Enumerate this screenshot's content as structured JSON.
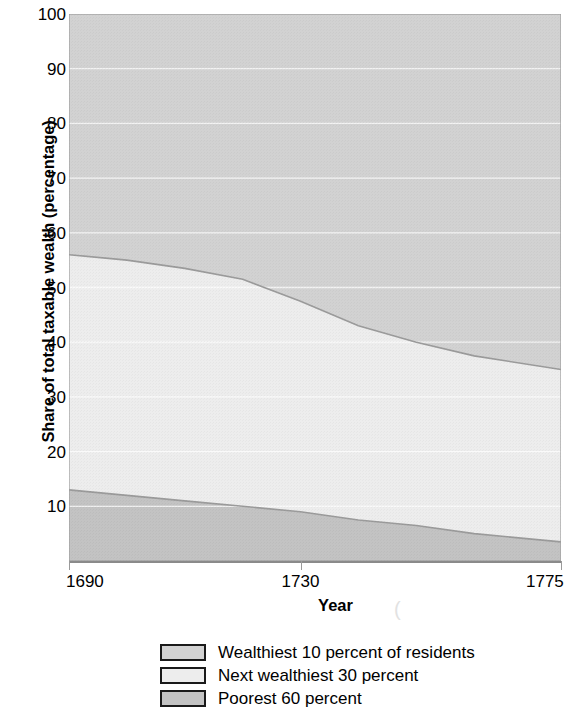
{
  "chart_data": {
    "type": "area",
    "title": "",
    "subtitle": "",
    "xlabel": "Year",
    "ylabel": "Share of total taxable wealth (percentage)",
    "xlim": [
      1690,
      1775
    ],
    "ylim": [
      0,
      100
    ],
    "grid": true,
    "stacked": true,
    "legend_position": "bottom",
    "x_tick_labels": [
      "1690",
      "1730",
      "1775"
    ],
    "x_ticks": [
      1690,
      1730,
      1775
    ],
    "y_tick_labels": [
      "100",
      "90",
      "80",
      "70",
      "60",
      "50",
      "40",
      "30",
      "20",
      "10"
    ],
    "y_ticks": [
      100,
      90,
      80,
      70,
      60,
      50,
      40,
      30,
      20,
      10
    ],
    "x": [
      1690,
      1700,
      1710,
      1720,
      1730,
      1740,
      1750,
      1760,
      1775
    ],
    "series": [
      {
        "name": "Wealthiest 10 percent of residents",
        "color": "#d2d2d2",
        "values": [
          44.0,
          45.0,
          46.5,
          48.5,
          52.5,
          57.0,
          60.0,
          62.5,
          65.0
        ],
        "cumulative_top": [
          100,
          100,
          100,
          100,
          100,
          100,
          100,
          100,
          100
        ],
        "cumulative_bottom": [
          56.0,
          55.0,
          53.5,
          51.5,
          47.5,
          43.0,
          40.0,
          37.5,
          35.0
        ]
      },
      {
        "name": "Next wealthiest 30 percent",
        "color": "#ededed",
        "values": [
          43.0,
          43.0,
          42.5,
          41.5,
          38.5,
          35.5,
          33.5,
          32.5,
          31.5
        ],
        "cumulative_top": [
          56.0,
          55.0,
          53.5,
          51.5,
          47.5,
          43.0,
          40.0,
          37.5,
          35.0
        ],
        "cumulative_bottom": [
          13.0,
          12.0,
          11.0,
          10.0,
          9.0,
          7.5,
          6.5,
          5.0,
          3.5
        ]
      },
      {
        "name": "Poorest 60 percent",
        "color": "#c3c3c3",
        "values": [
          13.0,
          12.0,
          11.0,
          10.0,
          9.0,
          7.5,
          6.5,
          5.0,
          3.5
        ],
        "cumulative_top": [
          13.0,
          12.0,
          11.0,
          10.0,
          9.0,
          7.5,
          6.5,
          5.0,
          3.5
        ],
        "cumulative_bottom": [
          0,
          0,
          0,
          0,
          0,
          0,
          0,
          0,
          0
        ]
      }
    ]
  },
  "axes": {
    "y_title": "Share of total taxable wealth (percentage)",
    "x_title": "Year",
    "y_tick_labels": [
      "100",
      "90",
      "80",
      "70",
      "60",
      "50",
      "40",
      "30",
      "20",
      "10"
    ],
    "x_tick_labels": [
      "1690",
      "1730",
      "1775"
    ]
  },
  "legend": {
    "items": [
      {
        "label": "Wealthiest 10 percent of residents",
        "color": "#d2d2d2"
      },
      {
        "label": "Next wealthiest 30 percent",
        "color": "#ededed"
      },
      {
        "label": "Poorest 60 percent",
        "color": "#c3c3c3"
      }
    ]
  },
  "artifact": {
    "mark": "("
  }
}
